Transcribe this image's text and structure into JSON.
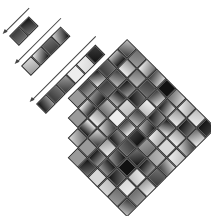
{
  "diagram": {
    "grid": {
      "rows": 9,
      "cols": 9,
      "patch_size_px": 14,
      "orientation_deg": -45
    },
    "strips": [
      {
        "name": "strip-1",
        "patches": 2,
        "arrow": "scan-direction-arrow"
      },
      {
        "name": "strip-2",
        "patches": 4,
        "arrow": "scan-direction-arrow"
      },
      {
        "name": "strip-3",
        "patches": 6,
        "arrow": "scan-direction-arrow"
      }
    ],
    "colors": {
      "patch_border": "#2a2a2a",
      "arrow": "#444444",
      "background": "#ffffff",
      "tones": [
        "#111111",
        "#3a3a3a",
        "#6e6e6e",
        "#9a9a9a",
        "#bdbdbd",
        "#d8d8d8",
        "#eeeeee"
      ]
    }
  }
}
